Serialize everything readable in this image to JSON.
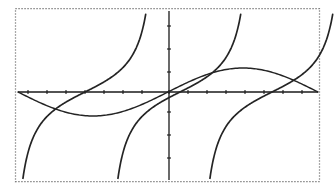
{
  "figure": {
    "background_color": "#ffffff",
    "border": {
      "style": "dotted",
      "color": "#555555",
      "x": 15,
      "y": 8,
      "width": 305,
      "height": 174
    }
  },
  "chart_data": {
    "type": "line",
    "title": "",
    "subtitle": "",
    "xlabel": "",
    "ylabel": "",
    "grid": false,
    "legend_position": "none",
    "axes": {
      "origin_px": [
        169,
        92
      ],
      "x_axis": {
        "label": "",
        "pixel_y": 92,
        "pixel_x_start": 18,
        "pixel_x_end": 318,
        "range": [
          -3.14159,
          3.14159
        ],
        "tick_values": [
          -2.748,
          -2.356,
          -1.963,
          -1.571,
          -1.178,
          -0.785,
          -0.393,
          0,
          0.393,
          0.785,
          1.178,
          1.571,
          1.963,
          2.356,
          2.748
        ],
        "tick_labels": [],
        "tick_pixels": [
          28,
          47,
          66,
          85,
          104,
          123,
          142,
          169,
          188,
          207,
          226,
          245,
          264,
          283,
          302
        ]
      },
      "y_axis": {
        "label": "",
        "pixel_x": 169,
        "pixel_y_start": 11,
        "pixel_y_end": 180,
        "range": [
          -3.2,
          3.2
        ],
        "tick_values": [
          -2.5,
          -1.5,
          -0.5,
          0.5,
          1.5,
          2.5
        ],
        "tick_labels": [],
        "tick_pixels": [
          158,
          135,
          112,
          72,
          49,
          26
        ]
      }
    },
    "series": [
      {
        "name": "sine",
        "function": "sin(x)",
        "style": "solid",
        "color": "#242424",
        "amplitude_px": 24,
        "key_points": [
          {
            "x": -3.14159,
            "y": 0,
            "px": [
              18,
              92
            ]
          },
          {
            "x": -2.356,
            "y": -0.707,
            "px": [
              47,
              109
            ]
          },
          {
            "x": -1.571,
            "y": -1.0,
            "px": [
              68,
              116
            ]
          },
          {
            "x": -0.785,
            "y": -0.707,
            "px": [
              123,
              109
            ]
          },
          {
            "x": 0,
            "y": 0,
            "px": [
              169,
              92
            ]
          },
          {
            "x": 1.571,
            "y": 1.0,
            "px": [
              165,
              68
            ]
          },
          {
            "x": 2.356,
            "y": 0.707,
            "px": [
              226,
              75
            ]
          },
          {
            "x": 3.14159,
            "y": 0,
            "px": [
              318,
              92
            ]
          }
        ]
      },
      {
        "name": "tangent-branch-left",
        "function": "tan(x)",
        "style": "solid",
        "color": "#242424",
        "asymptote_x": 0,
        "zero_crossing_px": [
          85,
          92
        ]
      },
      {
        "name": "tangent-branch-middle",
        "function": "tan(x)",
        "style": "solid",
        "color": "#242424",
        "asymptote_x": 0,
        "zero_crossing_px": [
          180,
          92
        ]
      },
      {
        "name": "tangent-branch-right",
        "function": "tan(x)",
        "style": "solid",
        "color": "#242424",
        "asymptote_x": 0,
        "zero_crossing_px": [
          272,
          92
        ]
      }
    ]
  }
}
